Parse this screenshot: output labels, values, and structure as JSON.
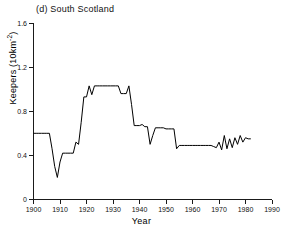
{
  "figure": {
    "panel_label": "(d) South Scotland",
    "background_color": "#ffffff",
    "line_color": "#000000",
    "axis_color": "#1a1a1a"
  },
  "axes": {
    "x_title": "Year",
    "y_title_main": "Keepers (10km",
    "y_title_sup": "-2",
    "y_title_close": ")",
    "y_title_full": "Keepers (10km-2)"
  },
  "chart_data": {
    "type": "line",
    "title": "(d) South Scotland",
    "xlabel": "Year",
    "ylabel": "Keepers (10km-2)",
    "xlim": [
      1900,
      1990
    ],
    "ylim": [
      0,
      1.6
    ],
    "xticks": [
      1900,
      1910,
      1920,
      1930,
      1940,
      1950,
      1960,
      1970,
      1980,
      1990
    ],
    "xtick_labels": [
      "1900",
      "1910",
      "1920",
      "1930",
      "1940",
      "1950",
      "1960",
      "1970",
      "1980",
      "1990"
    ],
    "yticks": [
      0,
      0.4,
      0.8,
      1.2,
      1.6
    ],
    "ytick_labels": [
      "0",
      "0.4",
      "0.8",
      "1.2",
      "1.6"
    ],
    "grid": false,
    "legend": false,
    "series": [
      {
        "name": "South Scotland keeper density",
        "x": [
          1900,
          1901,
          1902,
          1903,
          1904,
          1905,
          1906,
          1907,
          1908,
          1909,
          1910,
          1911,
          1912,
          1913,
          1914,
          1915,
          1916,
          1917,
          1918,
          1919,
          1920,
          1921,
          1922,
          1923,
          1924,
          1925,
          1926,
          1927,
          1928,
          1929,
          1930,
          1931,
          1932,
          1933,
          1934,
          1935,
          1936,
          1937,
          1938,
          1939,
          1940,
          1941,
          1942,
          1943,
          1944,
          1945,
          1946,
          1947,
          1948,
          1949,
          1950,
          1951,
          1952,
          1953,
          1954,
          1955,
          1956,
          1957,
          1958,
          1959,
          1960,
          1961,
          1962,
          1963,
          1964,
          1965,
          1966,
          1967,
          1968,
          1969,
          1970,
          1971,
          1972,
          1973,
          1974,
          1975,
          1976,
          1977,
          1978,
          1979,
          1980,
          1981,
          1982
        ],
        "y": [
          0.6,
          0.6,
          0.6,
          0.6,
          0.6,
          0.6,
          0.6,
          0.46,
          0.3,
          0.2,
          0.34,
          0.42,
          0.42,
          0.42,
          0.42,
          0.42,
          0.52,
          0.5,
          0.7,
          0.93,
          0.93,
          1.03,
          0.95,
          1.03,
          1.03,
          1.03,
          1.03,
          1.03,
          1.03,
          1.03,
          1.03,
          1.03,
          1.03,
          0.96,
          0.96,
          0.96,
          1.03,
          0.86,
          0.67,
          0.67,
          0.67,
          0.68,
          0.66,
          0.66,
          0.5,
          0.58,
          0.65,
          0.65,
          0.65,
          0.65,
          0.64,
          0.64,
          0.64,
          0.64,
          0.46,
          0.49,
          0.49,
          0.49,
          0.49,
          0.49,
          0.49,
          0.49,
          0.49,
          0.49,
          0.49,
          0.49,
          0.49,
          0.49,
          0.48,
          0.47,
          0.52,
          0.45,
          0.58,
          0.46,
          0.55,
          0.47,
          0.56,
          0.5,
          0.58,
          0.52,
          0.56,
          0.55,
          0.55
        ]
      }
    ]
  }
}
